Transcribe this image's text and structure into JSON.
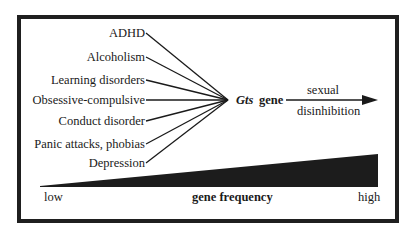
{
  "causes": [
    {
      "label": "ADHD",
      "y": 26
    },
    {
      "label": "Alcoholism",
      "y": 51
    },
    {
      "label": "Learning disorders",
      "y": 75
    },
    {
      "label": "Obsessive-compulsive",
      "y": 93
    },
    {
      "label": "Conduct disorder",
      "y": 114
    },
    {
      "label": "Panic attacks, phobias",
      "y": 137
    },
    {
      "label": "Depression",
      "y": 156
    }
  ],
  "center": {
    "gene_name": "Gts",
    "gene_word": "gene"
  },
  "outcome": {
    "line1": "sexual",
    "line2": "disinhibition"
  },
  "frequency_scale": {
    "low_label": "low",
    "high_label": "high",
    "title": "gene frequency"
  },
  "colors": {
    "ink": "#1a1a1a",
    "frame": "#1f1f1f",
    "background": "#ffffff"
  }
}
